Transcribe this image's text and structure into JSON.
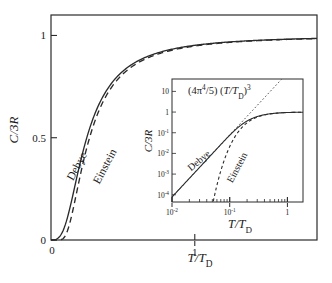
{
  "figure": {
    "name": "debye-einstein-heat-capacity",
    "background": "#ffffff",
    "ink": "#2b2b2b"
  },
  "main_plot": {
    "ylabel": "C/3R",
    "xlabel": "T/T",
    "xlabel_sub": "D",
    "y_ticks": [
      {
        "value": 0,
        "label": "0"
      },
      {
        "value": 0.5,
        "label": "0.5"
      },
      {
        "value": 1,
        "label": "1"
      }
    ],
    "x_ticks": [
      {
        "value": 0,
        "label": "0"
      },
      {
        "value": 1,
        "label": "1"
      }
    ],
    "xlim": [
      0,
      1.85
    ],
    "ylim": [
      0,
      1.1
    ],
    "curve_labels": [
      {
        "name": "debye",
        "text": "Debye"
      },
      {
        "name": "einstein",
        "text": "Einstein"
      }
    ]
  },
  "inset_plot": {
    "ylabel": "C/3R",
    "xlabel": "T/T",
    "xlabel_sub": "D",
    "annotation": {
      "prefix": "(4π",
      "sup1": "4",
      "mid": "/5) (T/T",
      "sub": "D",
      "close": ")",
      "sup2": "3"
    },
    "y_ticks": [
      {
        "value": 1,
        "mantissa": "10",
        "exp": ""
      },
      {
        "value": 0,
        "mantissa": "1",
        "exp": ""
      },
      {
        "value": -1,
        "mantissa": "10",
        "exp": "-1"
      },
      {
        "value": -2,
        "mantissa": "10",
        "exp": "-2"
      },
      {
        "value": -3,
        "mantissa": "10",
        "exp": "-3"
      },
      {
        "value": -4,
        "mantissa": "10",
        "exp": "-4"
      }
    ],
    "x_ticks": [
      {
        "value": -2,
        "mantissa": "10",
        "exp": "-2"
      },
      {
        "value": -1,
        "mantissa": "10",
        "exp": "-1"
      },
      {
        "value": 0,
        "mantissa": "1",
        "exp": ""
      }
    ],
    "xlim_log": [
      -2,
      0.27
    ],
    "ylim_log": [
      -4.35,
      1.6
    ],
    "curve_labels": [
      {
        "name": "debye",
        "text": "Debye"
      },
      {
        "name": "einstein",
        "text": "Einstein"
      }
    ]
  },
  "chart_data": {
    "type": "line",
    "title": "",
    "xlabel": "T/T_D",
    "ylabel": "C/3R",
    "xlim": [
      0,
      1.85
    ],
    "ylim": [
      0,
      1.1
    ],
    "grid": false,
    "legend": "inline-curve-labels",
    "series": [
      {
        "name": "Debye",
        "style": "solid",
        "x": [
          0,
          0.02,
          0.04,
          0.06,
          0.08,
          0.1,
          0.125,
          0.15,
          0.175,
          0.2,
          0.25,
          0.3,
          0.35,
          0.4,
          0.5,
          0.6,
          0.7,
          0.8,
          1.0,
          1.2,
          1.4,
          1.6,
          1.85
        ],
        "y": [
          0,
          0.0006,
          0.0048,
          0.016,
          0.0369,
          0.0692,
          0.1302,
          0.209,
          0.297,
          0.3848,
          0.5386,
          0.6479,
          0.7243,
          0.7782,
          0.8458,
          0.8838,
          0.9073,
          0.9227,
          0.9409,
          0.9505,
          0.9561,
          0.9597,
          0.9626
        ]
      },
      {
        "name": "Einstein",
        "style": "dashed",
        "x": [
          0,
          0.04,
          0.06,
          0.08,
          0.1,
          0.125,
          0.15,
          0.175,
          0.2,
          0.25,
          0.3,
          0.35,
          0.4,
          0.5,
          0.6,
          0.7,
          0.8,
          1.0,
          1.2,
          1.4,
          1.6,
          1.85
        ],
        "y": [
          0,
          0.0,
          0.0002,
          0.0022,
          0.0099,
          0.0336,
          0.074,
          0.128,
          0.19,
          0.317,
          0.432,
          0.527,
          0.603,
          0.711,
          0.78,
          0.825,
          0.856,
          0.896,
          0.919,
          0.934,
          0.944,
          0.952
        ]
      }
    ],
    "inset": {
      "type": "line",
      "xscale": "log",
      "yscale": "log",
      "xlabel": "T/T_D",
      "ylabel": "C/3R",
      "xlim": [
        0.01,
        1.86
      ],
      "ylim": [
        4.5e-05,
        40
      ],
      "annotation": "(4π⁴/5) (T/T_D)³",
      "series": [
        {
          "name": "Debye",
          "style": "solid",
          "note": "low-T limit C/3R = (4π⁴/5)(T/T_D)³, saturates near 1"
        },
        {
          "name": "Einstein",
          "style": "dashed",
          "note": "exponentially activated, falls far below Debye at low T"
        },
        {
          "name": "T-cubed asymptote",
          "style": "dotted",
          "note": "(4π⁴/5)(T/T_D)³ straight line of slope 3"
        }
      ]
    }
  }
}
